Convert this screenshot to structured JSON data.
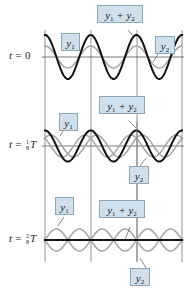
{
  "diagram": {
    "colors": {
      "sum_wave": "#111111",
      "component_wave": "#a8a8a8",
      "axis": "#555555",
      "gridline": "#777777",
      "callout_fill": "#cfe0ec",
      "callout_border": "#8aa6b8"
    },
    "panels": [
      {
        "time_label": {
          "prefix": "t = ",
          "numerator": "",
          "denominator": "",
          "value": "0",
          "suffix": ""
        },
        "labels": {
          "y1": "y",
          "y1_sub": "1",
          "sum_a": "y",
          "sum_a_sub": "1",
          "plus": " + ",
          "sum_b": "y",
          "sum_b_sub": "2",
          "y2": "y",
          "y2_sub": "2"
        }
      },
      {
        "time_label": {
          "prefix": "t = ",
          "numerator": "1",
          "denominator": "8",
          "value": "",
          "suffix": "T"
        },
        "labels": {
          "y1": "y",
          "y1_sub": "1",
          "sum_a": "y",
          "sum_a_sub": "1",
          "plus": " + ",
          "sum_b": "y",
          "sum_b_sub": "2",
          "y2": "y",
          "y2_sub": "2"
        }
      },
      {
        "time_label": {
          "prefix": "t = ",
          "numerator": "2",
          "denominator": "8",
          "value": "",
          "suffix": "T"
        },
        "labels": {
          "y1": "y",
          "y1_sub": "1",
          "sum_a": "y",
          "sum_a_sub": "1",
          "plus": " + ",
          "sum_b": "y",
          "sum_b_sub": "2",
          "y2": "y",
          "y2_sub": "2"
        }
      }
    ]
  }
}
